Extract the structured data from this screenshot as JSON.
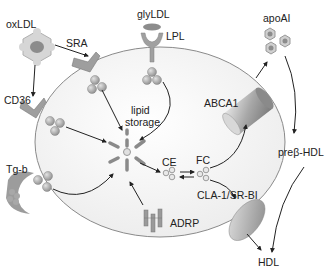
{
  "diagram": {
    "labels": {
      "oxldl": "oxLDL",
      "sra": "SRA",
      "glyldl": "glyLDL",
      "lpl": "LPL",
      "apoai": "apoAI",
      "cd36": "CD36",
      "lipid_storage_line1": "lipid",
      "lipid_storage_line2": "storage",
      "abca1": "ABCA1",
      "tgb": "Tg-b",
      "ce": "CE",
      "fc": "FC",
      "prebeta_hdl": "preβ-HDL",
      "cla1_srbi": "CLA-1/SR-BI",
      "adrp": "ADRP",
      "hdl": "HDL"
    },
    "colors": {
      "cell_fill": "#f2f2f2",
      "cell_border": "#8a8a8a",
      "receptor": "#9a9a9a",
      "lipid_droplet": "#a8a8a8",
      "arrow": "#222222",
      "nucleus": "#8c8c8c"
    }
  }
}
